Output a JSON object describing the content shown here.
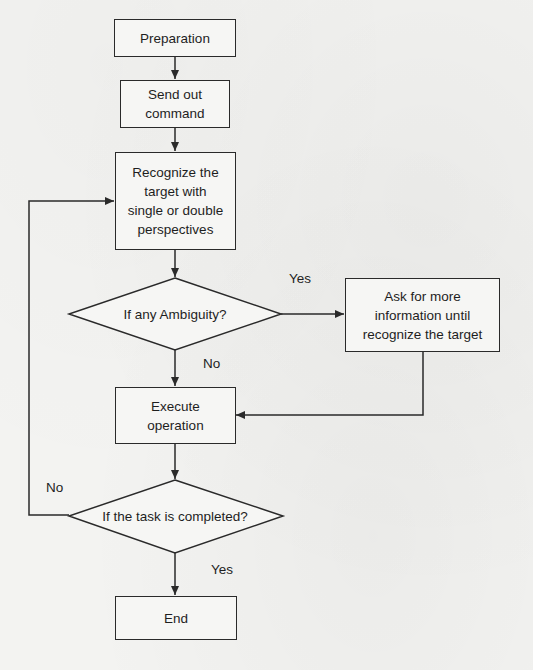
{
  "diagram": {
    "type": "flowchart",
    "nodes": {
      "preparation": {
        "label": "Preparation",
        "shape": "rectangle"
      },
      "send_command": {
        "label": "Send out\ncommand",
        "shape": "rectangle"
      },
      "recognize_target": {
        "label": "Recognize the\ntarget with\nsingle or double\nperspectives",
        "shape": "rectangle"
      },
      "ambiguity_check": {
        "label": "If any Ambiguity?",
        "shape": "diamond"
      },
      "ask_more_info": {
        "label": "Ask for more\ninformation until\nrecognize the target",
        "shape": "rectangle"
      },
      "execute_operation": {
        "label": "Execute\noperation",
        "shape": "rectangle"
      },
      "task_completed_check": {
        "label": "If the task is completed?",
        "shape": "diamond"
      },
      "end": {
        "label": "End",
        "shape": "rectangle"
      }
    },
    "edge_labels": {
      "ambiguity_yes": "Yes",
      "ambiguity_no": "No",
      "completed_no": "No",
      "completed_yes": "Yes"
    },
    "edges": [
      {
        "from": "preparation",
        "to": "send_command"
      },
      {
        "from": "send_command",
        "to": "recognize_target"
      },
      {
        "from": "recognize_target",
        "to": "ambiguity_check"
      },
      {
        "from": "ambiguity_check",
        "to": "ask_more_info",
        "label": "Yes"
      },
      {
        "from": "ambiguity_check",
        "to": "execute_operation",
        "label": "No"
      },
      {
        "from": "ask_more_info",
        "to": "execute_operation"
      },
      {
        "from": "execute_operation",
        "to": "task_completed_check"
      },
      {
        "from": "task_completed_check",
        "to": "recognize_target",
        "label": "No"
      },
      {
        "from": "task_completed_check",
        "to": "end",
        "label": "Yes"
      }
    ],
    "colors": {
      "background": "#f3f3f1",
      "stroke": "#2a2a2a",
      "text": "#1e1e1e"
    }
  }
}
